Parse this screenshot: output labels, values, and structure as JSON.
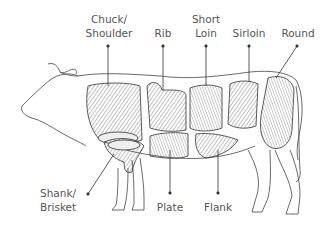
{
  "diagram": {
    "colors": {
      "line": "#333333",
      "label": "#555555",
      "background": "#ffffff",
      "shade": "#888888"
    },
    "labels": [
      {
        "id": "chuck",
        "lines": [
          "Chuck/",
          "Shoulder"
        ]
      },
      {
        "id": "rib",
        "lines": [
          "Rib"
        ]
      },
      {
        "id": "short-loin",
        "lines": [
          "Short",
          "Loin"
        ]
      },
      {
        "id": "sirloin",
        "lines": [
          "Sirloin"
        ]
      },
      {
        "id": "round",
        "lines": [
          "Round"
        ]
      },
      {
        "id": "shank",
        "lines": [
          "Shank/",
          "Brisket"
        ]
      },
      {
        "id": "plate",
        "lines": [
          "Plate"
        ]
      },
      {
        "id": "flank",
        "lines": [
          "Flank"
        ]
      }
    ]
  }
}
